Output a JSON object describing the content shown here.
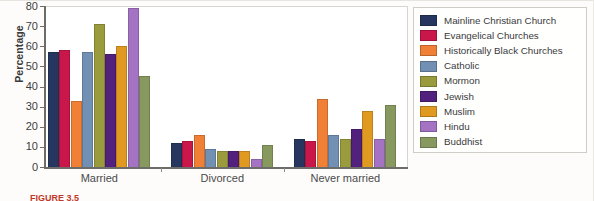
{
  "figure": {
    "caption_prefix": "FIGURE 3.5",
    "caption_rest": ""
  },
  "legend": {
    "position": "right",
    "items": [
      {
        "label": "Mainline Christian Church",
        "color": "#26365f"
      },
      {
        "label": "Evangelical Churches",
        "color": "#c9174b"
      },
      {
        "label": "Historically Black Churches",
        "color": "#ef8036"
      },
      {
        "label": "Catholic",
        "color": "#7190b4"
      },
      {
        "label": "Mormon",
        "color": "#9a9b3c"
      },
      {
        "label": "Jewish",
        "color": "#52217e"
      },
      {
        "label": "Muslim",
        "color": "#e09a22"
      },
      {
        "label": "Hindu",
        "color": "#a473c4"
      },
      {
        "label": "Buddhist",
        "color": "#87995f"
      }
    ]
  },
  "axes": {
    "ylabel": "Percentage",
    "xlabel": "",
    "yticks": [
      "0",
      "10",
      "20",
      "30",
      "40",
      "50",
      "60",
      "70",
      "80"
    ],
    "xticks": [
      "Married",
      "Divorced",
      "Never married"
    ]
  },
  "chart_data": {
    "type": "bar",
    "title": "",
    "subtitle": "",
    "xlabel": "",
    "ylabel": "Percentage",
    "ylim": [
      0,
      80
    ],
    "ytick_step": 10,
    "grid": false,
    "legend_position": "right",
    "categories": [
      "Married",
      "Divorced",
      "Never married"
    ],
    "series": [
      {
        "name": "Mainline Christian Church",
        "color": "#26365f",
        "values": [
          57,
          12,
          14
        ]
      },
      {
        "name": "Evangelical Churches",
        "color": "#c9174b",
        "values": [
          58,
          13,
          13
        ]
      },
      {
        "name": "Historically Black Churches",
        "color": "#ef8036",
        "values": [
          33,
          16,
          34
        ]
      },
      {
        "name": "Catholic",
        "color": "#7190b4",
        "values": [
          57,
          9,
          16
        ]
      },
      {
        "name": "Mormon",
        "color": "#9a9b3c",
        "values": [
          71,
          8,
          14
        ]
      },
      {
        "name": "Jewish",
        "color": "#52217e",
        "values": [
          56,
          8,
          19
        ]
      },
      {
        "name": "Muslim",
        "color": "#e09a22",
        "values": [
          60,
          8,
          28
        ]
      },
      {
        "name": "Hindu",
        "color": "#a473c4",
        "values": [
          79,
          4,
          14
        ]
      },
      {
        "name": "Buddhist",
        "color": "#87995f",
        "values": [
          45,
          11,
          31
        ]
      }
    ]
  }
}
